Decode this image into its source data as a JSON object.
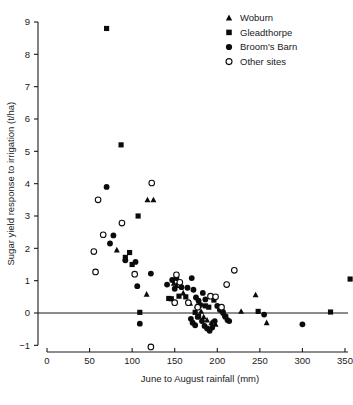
{
  "chart_data": {
    "type": "scatter",
    "title": "",
    "xlabel": "June to August rainfall (mm)",
    "ylabel": "Sugar yield response to irrigation (t/ha)",
    "xlim": [
      0,
      360
    ],
    "ylim": [
      -1,
      9
    ],
    "xticks": [
      0,
      50,
      100,
      150,
      200,
      250,
      300,
      350
    ],
    "yticks": [
      -1,
      0,
      1,
      2,
      3,
      4,
      5,
      6,
      7,
      8,
      9
    ],
    "xtick_labels": [
      "0",
      "50",
      "100",
      "150",
      "200",
      "250",
      "300",
      "350"
    ],
    "ytick_labels": [
      "-1",
      "0",
      "1",
      "2",
      "3",
      "4",
      "5",
      "6",
      "7",
      "8",
      "9"
    ],
    "grid": false,
    "zero_reference_line": 0,
    "legend_position": "top-right",
    "series": [
      {
        "name": "Woburn",
        "marker": "filled-triangle",
        "color": "#0b0b0b",
        "points": [
          [
            82,
            1.95
          ],
          [
            118,
            3.5
          ],
          [
            125,
            3.5
          ],
          [
            117,
            0.58
          ],
          [
            149,
            0.92
          ],
          [
            152,
            0.85
          ],
          [
            160,
            0.62
          ],
          [
            168,
            0.3
          ],
          [
            176,
            0.22
          ],
          [
            181,
            0.05
          ],
          [
            184,
            -0.12
          ],
          [
            188,
            -0.22
          ],
          [
            193,
            -0.3
          ],
          [
            198,
            -0.35
          ],
          [
            228,
            0.05
          ],
          [
            245,
            0.56
          ],
          [
            258,
            -0.3
          ]
        ]
      },
      {
        "name": "Gleadthorpe",
        "marker": "filled-square",
        "color": "#0b0b0b",
        "points": [
          [
            70,
            8.8
          ],
          [
            87,
            5.2
          ],
          [
            107,
            3.0
          ],
          [
            92,
            1.72
          ],
          [
            97,
            1.87
          ],
          [
            100,
            1.5
          ],
          [
            109,
            0.02
          ],
          [
            143,
            0.45
          ],
          [
            146,
            0.44
          ],
          [
            155,
            0.52
          ],
          [
            163,
            0.5
          ],
          [
            174,
            0.02
          ],
          [
            178,
            -0.1
          ],
          [
            186,
            0.22
          ],
          [
            190,
            0.18
          ],
          [
            196,
            0.4
          ],
          [
            207,
            0.0
          ],
          [
            210,
            -0.12
          ],
          [
            248,
            0.05
          ],
          [
            333,
            0.03
          ],
          [
            356,
            1.05
          ]
        ]
      },
      {
        "name": "Broom's Barn",
        "marker": "filled-circle",
        "color": "#0b0b0b",
        "points": [
          [
            70,
            3.9
          ],
          [
            78,
            2.4
          ],
          [
            74,
            2.15
          ],
          [
            92,
            1.63
          ],
          [
            104,
            1.58
          ],
          [
            106,
            0.83
          ],
          [
            109,
            -0.33
          ],
          [
            122,
            1.22
          ],
          [
            141,
            0.88
          ],
          [
            147,
            1.02
          ],
          [
            152,
            1.08
          ],
          [
            150,
            0.75
          ],
          [
            158,
            0.8
          ],
          [
            165,
            0.78
          ],
          [
            170,
            1.08
          ],
          [
            172,
            0.72
          ],
          [
            175,
            0.48
          ],
          [
            178,
            0.38
          ],
          [
            180,
            0.25
          ],
          [
            183,
            0.62
          ],
          [
            186,
            0.42
          ],
          [
            169,
            -0.18
          ],
          [
            171,
            -0.3
          ],
          [
            174,
            -0.38
          ],
          [
            177,
            -0.12
          ],
          [
            182,
            -0.25
          ],
          [
            185,
            -0.4
          ],
          [
            188,
            -0.48
          ],
          [
            191,
            -0.55
          ],
          [
            194,
            -0.45
          ],
          [
            197,
            -0.25
          ],
          [
            200,
            0.22
          ],
          [
            203,
            0.1
          ],
          [
            206,
            0.05
          ],
          [
            209,
            -0.1
          ],
          [
            212,
            -0.22
          ],
          [
            214,
            -0.25
          ],
          [
            255,
            -0.05
          ],
          [
            300,
            -0.35
          ]
        ]
      },
      {
        "name": "Other sites",
        "marker": "open-circle",
        "color": "#0b0b0b",
        "points": [
          [
            55,
            1.9
          ],
          [
            57,
            1.27
          ],
          [
            60,
            3.5
          ],
          [
            66,
            2.42
          ],
          [
            88,
            2.78
          ],
          [
            103,
            1.2
          ],
          [
            123,
            4.02
          ],
          [
            122,
            -1.05
          ],
          [
            152,
            1.18
          ],
          [
            156,
            0.95
          ],
          [
            150,
            0.32
          ],
          [
            166,
            0.32
          ],
          [
            177,
            0.18
          ],
          [
            192,
            0.52
          ],
          [
            198,
            0.5
          ],
          [
            205,
            0.18
          ],
          [
            211,
            0.88
          ],
          [
            220,
            1.32
          ]
        ]
      }
    ]
  },
  "legend": {
    "items": [
      {
        "label": "Woburn",
        "marker": "filled-triangle"
      },
      {
        "label": "Gleadthorpe",
        "marker": "filled-square"
      },
      {
        "label": "Broom's Barn",
        "marker": "filled-circle"
      },
      {
        "label": "Other sites",
        "marker": "open-circle"
      }
    ]
  }
}
